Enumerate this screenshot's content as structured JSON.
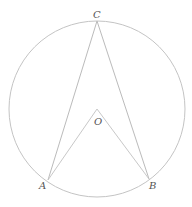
{
  "diagram": {
    "type": "circle-inscribed-angle",
    "circle": {
      "cx": 97,
      "cy": 109,
      "r": 88
    },
    "points": {
      "C": {
        "label": "C",
        "x": 97,
        "y": 21
      },
      "O": {
        "label": "O",
        "x": 97,
        "y": 109
      },
      "A": {
        "label": "A",
        "x": 48,
        "y": 180
      },
      "B": {
        "label": "B",
        "x": 149,
        "y": 179
      }
    },
    "segments": [
      "CA",
      "CB",
      "OA",
      "OB"
    ],
    "colors": {
      "stroke": "#bbbbbb",
      "label": "#555555"
    }
  }
}
